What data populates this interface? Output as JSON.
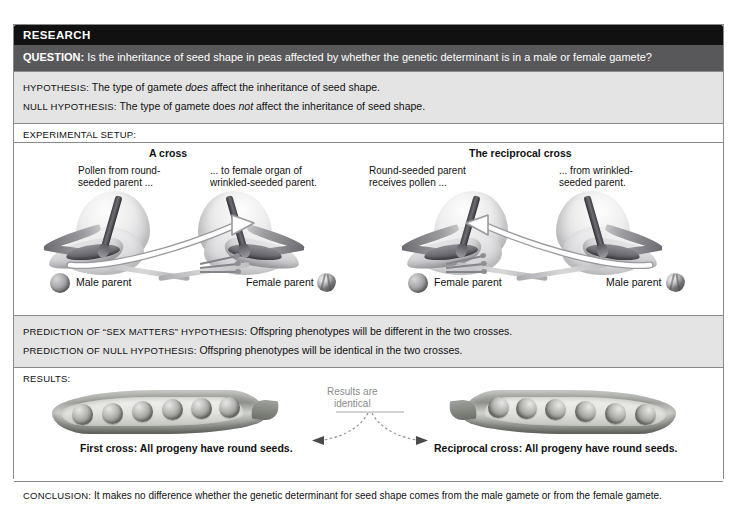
{
  "header": {
    "research_label": "RESEARCH",
    "question_prefix": "QUESTION:",
    "question_text": " Is the inheritance of seed shape in peas affected by whether the genetic determinant is in a male or female gamete?"
  },
  "hypotheses": {
    "hypothesis_prefix": "HYPOTHESIS:",
    "hypothesis_a": " The type of gamete ",
    "hypothesis_em": "does",
    "hypothesis_b": " affect the inheritance of seed shape.",
    "null_prefix": "NULL HYPOTHESIS:",
    "null_a": " The type of gamete does ",
    "null_em": "not",
    "null_b": " affect the inheritance of seed shape."
  },
  "setup": {
    "label": "EXPERIMENTAL SETUP:",
    "left_panel": {
      "title": "A cross",
      "callout_left": "Pollen from round-\nseeded parent ...",
      "callout_right": "... to female organ of\nwrinkled-seeded parent.",
      "parent_left": "Male parent",
      "parent_right": "Female parent",
      "seed_left": "round-seed-icon",
      "seed_right": "wrinkled-seed-icon"
    },
    "right_panel": {
      "title": "The reciprocal cross",
      "callout_left": "Round-seeded parent\nreceives pollen ...",
      "callout_right": "... from wrinkled-\nseeded parent.",
      "parent_left": "Female parent",
      "parent_right": "Male parent",
      "seed_left": "round-seed-icon",
      "seed_right": "wrinkled-seed-icon"
    }
  },
  "predictions": {
    "sex_matters_prefix": "PREDICTION OF “SEX MATTERS” HYPOTHESIS:",
    "sex_matters_text": " Offspring phenotypes will be different in the two crosses.",
    "null_prefix": "PREDICTION OF NULL HYPOTHESIS:",
    "null_text": " Offspring phenotypes will be identical in the two crosses."
  },
  "results": {
    "label": "RESULTS:",
    "note_line1": "Results are",
    "note_line2": "identical",
    "caption_left": "First cross: All progeny have round seeds.",
    "caption_right": "Reciprocal cross: All progeny have round seeds.",
    "pea_count_left": 6,
    "pea_count_right": 6
  },
  "conclusion": {
    "prefix": "CONCLUSION:",
    "text": " It makes no difference whether the genetic determinant for seed shape comes from the male gamete or from the female gamete."
  },
  "colors": {
    "research_bar": "#111111",
    "question_bar": "#58585a",
    "band_grey": "#e4e4e4",
    "frame_border": "#8a8a8a",
    "note_grey": "#8c8c8c"
  }
}
